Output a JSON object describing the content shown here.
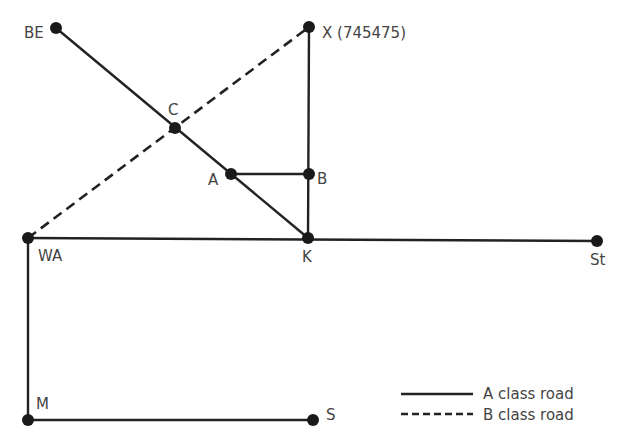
{
  "diagram": {
    "type": "road-network",
    "colors": {
      "road": "#222222",
      "node": "#1a1a1a",
      "label": "#444444"
    },
    "nodes": [
      {
        "id": "BE",
        "label": "BE",
        "x": 56,
        "y": 28
      },
      {
        "id": "X",
        "label": "X (745475)",
        "x": 309,
        "y": 27
      },
      {
        "id": "C",
        "label": "C",
        "x": 175,
        "y": 128
      },
      {
        "id": "A",
        "label": "A",
        "x": 231,
        "y": 174
      },
      {
        "id": "B",
        "label": "B",
        "x": 309,
        "y": 174
      },
      {
        "id": "WA",
        "label": "WA",
        "x": 28,
        "y": 238
      },
      {
        "id": "K",
        "label": "K",
        "x": 308,
        "y": 238
      },
      {
        "id": "St",
        "label": "St",
        "x": 597,
        "y": 241
      },
      {
        "id": "M",
        "label": "M",
        "x": 28,
        "y": 420
      },
      {
        "id": "S",
        "label": "S",
        "x": 313,
        "y": 420
      }
    ],
    "edges": [
      {
        "from": "BE",
        "to": "K",
        "class": "A"
      },
      {
        "from": "A",
        "to": "B",
        "class": "A"
      },
      {
        "from": "X",
        "to": "K",
        "class": "A"
      },
      {
        "from": "WA",
        "to": "St",
        "class": "A"
      },
      {
        "from": "WA",
        "to": "M",
        "class": "A"
      },
      {
        "from": "M",
        "to": "S",
        "class": "A"
      },
      {
        "from": "WA",
        "to": "X",
        "class": "B"
      }
    ]
  },
  "legend": {
    "a_class": "A class road",
    "b_class": "B class road"
  }
}
